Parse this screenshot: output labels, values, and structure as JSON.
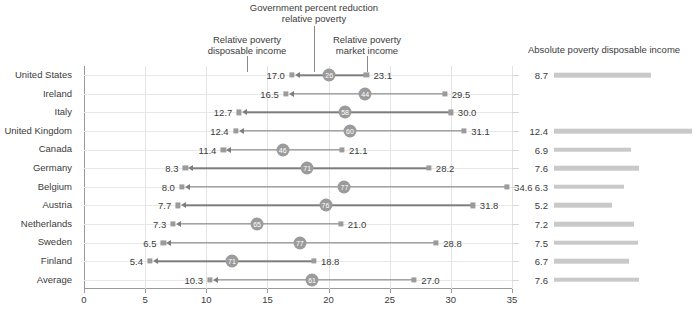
{
  "annotations": {
    "gov_reduction": "Government percent reduction\nrelative poverty",
    "gov_reduction_line1": "Government percent reduction",
    "gov_reduction_line2": "relative poverty",
    "disposable_line1": "Relative poverty",
    "disposable_line2": "disposable income",
    "market_line1": "Relative poverty",
    "market_line2": "market income",
    "right_panel_title": "Absolute poverty disposable income"
  },
  "chart_data": {
    "type": "bar",
    "xlabel": "",
    "ylabel": "",
    "xlim": [
      0,
      35
    ],
    "xticks": [
      0,
      5,
      10,
      15,
      20,
      25,
      30,
      35
    ],
    "xtick_labels": [
      "0",
      "5",
      "10",
      "15",
      "20",
      "25",
      "30",
      "35"
    ],
    "grid": true,
    "legend_position": "none",
    "categories": [
      "United States",
      "Ireland",
      "Italy",
      "United Kingdom",
      "Canada",
      "Germany",
      "Belgium",
      "Austria",
      "Netherlands",
      "Sweden",
      "Finland",
      "Average"
    ],
    "series": [
      {
        "name": "Relative poverty disposable income",
        "values": [
          17.0,
          16.5,
          12.7,
          12.4,
          11.4,
          8.3,
          8.0,
          7.7,
          7.3,
          6.5,
          5.4,
          10.3
        ]
      },
      {
        "name": "Relative poverty market income",
        "values": [
          23.1,
          29.5,
          30.0,
          31.1,
          21.1,
          28.2,
          34.6,
          31.8,
          21.0,
          28.8,
          18.8,
          27.0
        ]
      },
      {
        "name": "Government percent reduction relative poverty",
        "values": [
          26,
          44,
          58,
          60,
          46,
          71,
          77,
          76,
          65,
          77,
          71,
          61
        ]
      },
      {
        "name": "Absolute poverty disposable income",
        "values": [
          8.7,
          null,
          null,
          12.4,
          6.9,
          7.6,
          6.3,
          5.2,
          7.2,
          7.5,
          6.7,
          7.6
        ]
      }
    ]
  },
  "rows": [
    {
      "label": "United States",
      "disposable": "17.0",
      "market": "23.1",
      "pct": "26",
      "abs": "8.7",
      "abs_value": 8.7,
      "disp_value": 17.0,
      "mkt_value": 23.1,
      "pct_value": 26
    },
    {
      "label": "Ireland",
      "disposable": "16.5",
      "market": "29.5",
      "pct": "44",
      "abs": "",
      "abs_value": null,
      "disp_value": 16.5,
      "mkt_value": 29.5,
      "pct_value": 44
    },
    {
      "label": "Italy",
      "disposable": "12.7",
      "market": "30.0",
      "pct": "58",
      "abs": "",
      "abs_value": null,
      "disp_value": 12.7,
      "mkt_value": 30.0,
      "pct_value": 58
    },
    {
      "label": "United Kingdom",
      "disposable": "12.4",
      "market": "31.1",
      "pct": "60",
      "abs": "12.4",
      "abs_value": 12.4,
      "disp_value": 12.4,
      "mkt_value": 31.1,
      "pct_value": 60
    },
    {
      "label": "Canada",
      "disposable": "11.4",
      "market": "21.1",
      "pct": "46",
      "abs": "6.9",
      "abs_value": 6.9,
      "disp_value": 11.4,
      "mkt_value": 21.1,
      "pct_value": 46
    },
    {
      "label": "Germany",
      "disposable": "8.3",
      "market": "28.2",
      "pct": "71",
      "abs": "7.6",
      "abs_value": 7.6,
      "disp_value": 8.3,
      "mkt_value": 28.2,
      "pct_value": 71
    },
    {
      "label": "Belgium",
      "disposable": "8.0",
      "market": "34.6",
      "pct": "77",
      "abs": "6.3",
      "abs_value": 6.3,
      "disp_value": 8.0,
      "mkt_value": 34.6,
      "pct_value": 77
    },
    {
      "label": "Austria",
      "disposable": "7.7",
      "market": "31.8",
      "pct": "76",
      "abs": "5.2",
      "abs_value": 5.2,
      "disp_value": 7.7,
      "mkt_value": 31.8,
      "pct_value": 76
    },
    {
      "label": "Netherlands",
      "disposable": "7.3",
      "market": "21.0",
      "pct": "65",
      "abs": "7.2",
      "abs_value": 7.2,
      "disp_value": 7.3,
      "mkt_value": 21.0,
      "pct_value": 65
    },
    {
      "label": "Sweden",
      "disposable": "6.5",
      "market": "28.8",
      "pct": "77",
      "abs": "7.5",
      "abs_value": 7.5,
      "disp_value": 6.5,
      "mkt_value": 28.8,
      "pct_value": 77
    },
    {
      "label": "Finland",
      "disposable": "5.4",
      "market": "18.8",
      "pct": "71",
      "abs": "6.7",
      "abs_value": 6.7,
      "disp_value": 5.4,
      "mkt_value": 18.8,
      "pct_value": 71
    },
    {
      "label": "Average",
      "disposable": "10.3",
      "market": "27.0",
      "pct": "61",
      "abs": "7.6",
      "abs_value": 7.6,
      "disp_value": 10.3,
      "mkt_value": 27.0,
      "pct_value": 61
    }
  ],
  "colors": {
    "marker": "#9b9b9b",
    "connector": "#7d7d7d",
    "grid": "#e3e3e3",
    "axis": "#9a9a9a",
    "bar": "#c9c9c9",
    "text": "#3b3b3b",
    "circle_text": "#ffffff"
  }
}
